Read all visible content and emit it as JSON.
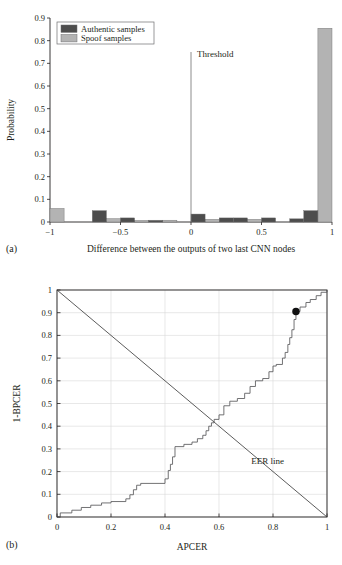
{
  "figure": {
    "panel_a_tag": "(a)",
    "panel_b_tag": "(b)"
  },
  "colors": {
    "authentic": "#4d4d4d",
    "spoof": "#b3b3b3",
    "axis": "#231f20",
    "grid": "#d9d9d9",
    "curve": "#59595b",
    "marker": "#111111",
    "background": "#ffffff"
  },
  "chart_data": [
    {
      "id": "panel-a",
      "type": "bar",
      "title": "",
      "xlabel": "Difference between the outputs of two last CNN nodes",
      "ylabel": "Probability",
      "xlim": [
        -1,
        1
      ],
      "ylim": [
        0,
        0.9
      ],
      "xticks": [
        "−1",
        "−0.5",
        "0",
        "0.5",
        "1"
      ],
      "xtick_values": [
        -1,
        -0.5,
        0,
        0.5,
        1
      ],
      "yticks": [
        "0",
        "0.1",
        "0.2",
        "0.3",
        "0.4",
        "0.5",
        "0.6",
        "0.7",
        "0.8",
        "0.9"
      ],
      "ytick_values": [
        0,
        0.1,
        0.2,
        0.3,
        0.4,
        0.5,
        0.6,
        0.7,
        0.8,
        0.9
      ],
      "grid": false,
      "legend_position": "upper left",
      "annotations": [
        {
          "text": "Threshold",
          "x": 0.04,
          "y": 0.73
        }
      ],
      "threshold": {
        "x": 0.0,
        "y_top": 0.75,
        "label": "Threshold"
      },
      "bin_edges": [
        -1.0,
        -0.9,
        -0.8,
        -0.7,
        -0.6,
        -0.5,
        -0.4,
        -0.3,
        -0.2,
        -0.1,
        0.0,
        0.1,
        0.2,
        0.3,
        0.4,
        0.5,
        0.6,
        0.7,
        0.8,
        0.9,
        1.0
      ],
      "series": [
        {
          "name": "Authentic samples",
          "color": "#4d4d4d",
          "values": [
            0.0,
            0.0,
            0.0,
            0.05,
            0.0,
            0.018,
            0.0,
            0.006,
            0.0,
            0.0,
            0.035,
            0.0,
            0.018,
            0.018,
            0.0,
            0.018,
            0.0,
            0.014,
            0.05,
            0.0
          ]
        },
        {
          "name": "Spoof samples",
          "color": "#b3b3b3",
          "values": [
            0.06,
            0.0,
            0.0,
            0.0,
            0.015,
            0.0,
            0.007,
            0.008,
            0.008,
            0.0,
            0.0,
            0.012,
            0.0,
            0.0,
            0.012,
            0.0,
            0.0,
            0.0,
            0.0,
            0.855
          ]
        }
      ]
    },
    {
      "id": "panel-b",
      "type": "line",
      "title": "",
      "xlabel": "APCER",
      "ylabel": "1-BPCER",
      "xlim": [
        0,
        1
      ],
      "ylim": [
        0,
        1
      ],
      "xticks": [
        "0",
        "0.2",
        "0.4",
        "0.6",
        "0.8",
        "1"
      ],
      "xtick_values": [
        0,
        0.2,
        0.4,
        0.6,
        0.8,
        1
      ],
      "yticks": [
        "0",
        "0.1",
        "0.2",
        "0.3",
        "0.4",
        "0.5",
        "0.6",
        "0.7",
        "0.8",
        "0.9",
        "1"
      ],
      "ytick_values": [
        0,
        0.1,
        0.2,
        0.3,
        0.4,
        0.5,
        0.6,
        0.7,
        0.8,
        0.9,
        1
      ],
      "grid": true,
      "annotations": [
        {
          "text": "EER line",
          "x": 0.78,
          "y": 0.235
        }
      ],
      "markers": [
        {
          "x": 0.885,
          "y": 0.905,
          "style": "filled-circle",
          "size": 6
        }
      ],
      "series": [
        {
          "name": "EER line",
          "type": "line",
          "color": "#3f3f3f",
          "points": [
            [
              0,
              1
            ],
            [
              1,
              0
            ]
          ]
        },
        {
          "name": "ROC",
          "type": "step",
          "color": "#59595b",
          "points": [
            [
              0.0,
              0.0
            ],
            [
              0.012,
              0.0
            ],
            [
              0.012,
              0.018
            ],
            [
              0.055,
              0.018
            ],
            [
              0.055,
              0.03
            ],
            [
              0.09,
              0.03
            ],
            [
              0.09,
              0.042
            ],
            [
              0.125,
              0.042
            ],
            [
              0.125,
              0.052
            ],
            [
              0.165,
              0.052
            ],
            [
              0.165,
              0.062
            ],
            [
              0.2,
              0.062
            ],
            [
              0.2,
              0.068
            ],
            [
              0.255,
              0.068
            ],
            [
              0.255,
              0.08
            ],
            [
              0.27,
              0.08
            ],
            [
              0.27,
              0.098
            ],
            [
              0.283,
              0.098
            ],
            [
              0.283,
              0.12
            ],
            [
              0.295,
              0.12
            ],
            [
              0.295,
              0.14
            ],
            [
              0.31,
              0.14
            ],
            [
              0.31,
              0.148
            ],
            [
              0.4,
              0.148
            ],
            [
              0.4,
              0.168
            ],
            [
              0.412,
              0.168
            ],
            [
              0.412,
              0.205
            ],
            [
              0.42,
              0.205
            ],
            [
              0.42,
              0.232
            ],
            [
              0.428,
              0.232
            ],
            [
              0.428,
              0.265
            ],
            [
              0.437,
              0.265
            ],
            [
              0.437,
              0.31
            ],
            [
              0.47,
              0.31
            ],
            [
              0.47,
              0.32
            ],
            [
              0.5,
              0.32
            ],
            [
              0.5,
              0.33
            ],
            [
              0.52,
              0.33
            ],
            [
              0.52,
              0.345
            ],
            [
              0.54,
              0.345
            ],
            [
              0.54,
              0.36
            ],
            [
              0.552,
              0.36
            ],
            [
              0.552,
              0.38
            ],
            [
              0.562,
              0.38
            ],
            [
              0.562,
              0.4
            ],
            [
              0.572,
              0.4
            ],
            [
              0.572,
              0.415
            ],
            [
              0.582,
              0.415
            ],
            [
              0.582,
              0.43
            ],
            [
              0.6,
              0.43
            ],
            [
              0.6,
              0.45
            ],
            [
              0.618,
              0.45
            ],
            [
              0.618,
              0.49
            ],
            [
              0.64,
              0.49
            ],
            [
              0.64,
              0.51
            ],
            [
              0.668,
              0.51
            ],
            [
              0.668,
              0.522
            ],
            [
              0.695,
              0.522
            ],
            [
              0.695,
              0.545
            ],
            [
              0.715,
              0.545
            ],
            [
              0.715,
              0.575
            ],
            [
              0.735,
              0.575
            ],
            [
              0.735,
              0.6
            ],
            [
              0.762,
              0.6
            ],
            [
              0.762,
              0.61
            ],
            [
              0.785,
              0.61
            ],
            [
              0.785,
              0.64
            ],
            [
              0.8,
              0.64
            ],
            [
              0.8,
              0.665
            ],
            [
              0.812,
              0.665
            ],
            [
              0.812,
              0.672
            ],
            [
              0.835,
              0.672
            ],
            [
              0.835,
              0.7
            ],
            [
              0.845,
              0.7
            ],
            [
              0.845,
              0.725
            ],
            [
              0.855,
              0.725
            ],
            [
              0.855,
              0.76
            ],
            [
              0.862,
              0.76
            ],
            [
              0.862,
              0.79
            ],
            [
              0.87,
              0.79
            ],
            [
              0.87,
              0.825
            ],
            [
              0.878,
              0.825
            ],
            [
              0.878,
              0.87
            ],
            [
              0.885,
              0.87
            ],
            [
              0.885,
              0.905
            ],
            [
              0.9,
              0.905
            ],
            [
              0.9,
              0.925
            ],
            [
              0.922,
              0.925
            ],
            [
              0.922,
              0.945
            ],
            [
              0.938,
              0.945
            ],
            [
              0.938,
              0.958
            ],
            [
              0.96,
              0.958
            ],
            [
              0.96,
              0.975
            ],
            [
              0.978,
              0.975
            ],
            [
              0.978,
              0.99
            ],
            [
              1.0,
              0.99
            ],
            [
              1.0,
              1.0
            ]
          ]
        }
      ]
    }
  ]
}
